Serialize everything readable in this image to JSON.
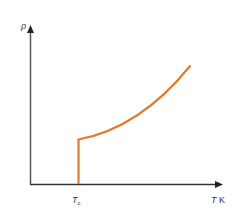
{
  "diagram": {
    "y_axis_label": "ρ",
    "x_axis_label_var": "T",
    "x_axis_label_unit": "K",
    "tick_label_main": "T",
    "tick_label_sub": "c",
    "colors": {
      "axis": "#3a3a3a",
      "curve": "#e07b2e"
    }
  }
}
